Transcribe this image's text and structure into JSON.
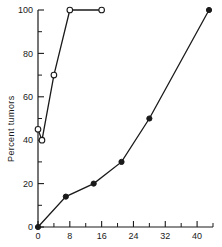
{
  "chart_data": {
    "type": "line",
    "title": "",
    "xlabel": "",
    "ylabel": "Percent tumors",
    "xlim": [
      0,
      44
    ],
    "ylim": [
      0,
      100
    ],
    "grid": false,
    "legend": "none",
    "x_ticks": [
      0,
      8,
      16,
      24,
      32,
      40
    ],
    "x_tick_labels": [
      "0",
      "8",
      "16",
      "24",
      "32",
      "40"
    ],
    "x_minor_ticks": [
      4,
      12,
      20,
      28,
      36,
      44
    ],
    "y_ticks": [
      0,
      20,
      40,
      60,
      80,
      100
    ],
    "y_tick_labels": [
      "0",
      "20",
      "40",
      "60",
      "80",
      "100"
    ],
    "y_minor_ticks": [
      10,
      30,
      50,
      70,
      90
    ],
    "series": [
      {
        "name": "open-circle-series",
        "marker": "open-circle",
        "x": [
          0,
          1,
          4,
          8,
          16
        ],
        "y": [
          45,
          40,
          70,
          100,
          100
        ]
      },
      {
        "name": "filled-circle-series",
        "marker": "filled-circle",
        "x": [
          0,
          7,
          14,
          21,
          28,
          43
        ],
        "y": [
          0,
          14,
          20,
          30,
          50,
          100
        ]
      }
    ]
  },
  "axes": {
    "ylabel": "Percent tumors"
  },
  "colors": {
    "ink": "#1a1a1a",
    "background": "#ffffff"
  }
}
